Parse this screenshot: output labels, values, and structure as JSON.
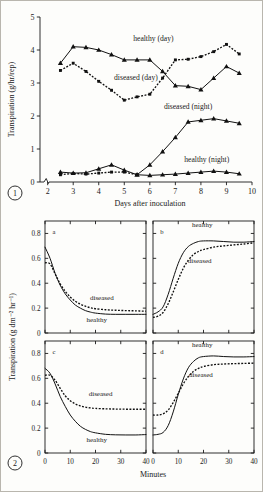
{
  "figure": {
    "panel1_number": "1",
    "panel2_number": "2"
  },
  "chart_data": [
    {
      "type": "line",
      "id": "panel-1",
      "title": "",
      "xlabel": "Days after inoculation",
      "ylabel": "Transpiration (g/hr/rep)",
      "xlim": [
        1.7,
        10
      ],
      "ylim": [
        0,
        5
      ],
      "xticks": [
        2,
        3,
        4,
        5,
        6,
        7,
        8,
        9,
        10
      ],
      "xtick_labels": [
        "2",
        "3",
        "4",
        "5",
        "6",
        "7",
        "8",
        "9",
        "10"
      ],
      "yticks": [
        0,
        1,
        2,
        3,
        4,
        5
      ],
      "ytick_labels": [
        "0",
        "1",
        "2",
        "3",
        "4",
        "5"
      ],
      "axis_break": true,
      "grid": false,
      "legend": "inline-annotations",
      "series": [
        {
          "name": "healthy (day)",
          "style": "solid",
          "marker": "triangle",
          "label_x": 5.35,
          "label_y": 4.27,
          "x": [
            2.5,
            3.0,
            3.5,
            4.0,
            4.5,
            5.0,
            5.5,
            6.0,
            6.5,
            7.0,
            7.5,
            8.0,
            8.5,
            9.0,
            9.5
          ],
          "y": [
            3.6,
            4.1,
            4.08,
            4.0,
            3.86,
            3.7,
            3.7,
            3.7,
            3.35,
            2.92,
            2.9,
            2.8,
            3.15,
            3.5,
            3.3
          ]
        },
        {
          "name": "diseased (day)",
          "style": "dotted",
          "marker": "square",
          "label_x": 4.6,
          "label_y": 3.1,
          "x": [
            2.5,
            3.0,
            3.5,
            4.0,
            4.5,
            5.0,
            5.5,
            6.0,
            6.5,
            7.0,
            7.5,
            8.0,
            8.5,
            9.0,
            9.5
          ],
          "y": [
            3.38,
            3.6,
            3.35,
            3.05,
            2.78,
            2.48,
            2.58,
            2.66,
            3.15,
            3.7,
            3.72,
            3.8,
            3.95,
            4.17,
            3.88
          ]
        },
        {
          "name": "diseased (night)",
          "style": "solid",
          "marker": "triangle",
          "label_x": 6.55,
          "label_y": 2.2,
          "x": [
            5.5,
            6.0,
            6.5,
            7.0,
            7.5,
            8.0,
            8.5,
            9.0,
            9.5
          ],
          "y": [
            0.22,
            0.52,
            0.92,
            1.35,
            1.82,
            1.87,
            1.92,
            1.85,
            1.78
          ]
        },
        {
          "name": "healthy (night)",
          "style": "solid",
          "marker": "triangle",
          "label_x": 7.35,
          "label_y": 0.62,
          "x": [
            2.5,
            3.0,
            3.5,
            4.0,
            4.5,
            5.0,
            5.5,
            6.0,
            6.5,
            7.0,
            7.5,
            8.0,
            8.5,
            9.0,
            9.5
          ],
          "y": [
            0.3,
            0.27,
            0.28,
            0.4,
            0.52,
            0.36,
            0.22,
            0.2,
            0.22,
            0.24,
            0.27,
            0.3,
            0.33,
            0.3,
            0.25
          ]
        },
        {
          "name": "healthy (night) secondary",
          "style": "dotted",
          "marker": "square",
          "x": [
            2.5,
            3.0,
            3.5,
            4.0,
            4.5,
            5.0,
            5.5
          ],
          "y": [
            0.22,
            0.26,
            0.24,
            0.27,
            0.3,
            0.3,
            0.22
          ]
        }
      ]
    },
    {
      "type": "line",
      "id": "panel-2a",
      "letter": "a",
      "xlabel": "Minutes",
      "ylabel": "Transpiration (g dm⁻² hr⁻¹)",
      "xlim": [
        0,
        40
      ],
      "ylim": [
        0,
        0.9
      ],
      "xticks": [
        0,
        10,
        20,
        30,
        40
      ],
      "xtick_labels": [
        "",
        "",
        "",
        "",
        ""
      ],
      "yticks": [
        0,
        0.2,
        0.4,
        0.6,
        0.8
      ],
      "ytick_labels": [
        "0",
        "0.2",
        "0.4",
        "0.6",
        "0.8"
      ],
      "grid": false,
      "series": [
        {
          "name": "healthy",
          "style": "solid",
          "label_x": 20.5,
          "label_y": 0.085,
          "x": [
            0,
            2,
            4,
            6,
            8,
            10,
            12,
            14,
            16,
            18,
            20,
            24,
            28,
            32,
            36,
            40
          ],
          "y": [
            0.69,
            0.6,
            0.48,
            0.385,
            0.315,
            0.265,
            0.225,
            0.2,
            0.18,
            0.168,
            0.16,
            0.152,
            0.15,
            0.15,
            0.15,
            0.15
          ]
        },
        {
          "name": "diseased",
          "style": "dotted",
          "label_x": 22.5,
          "label_y": 0.265,
          "x": [
            0,
            2,
            4,
            6,
            8,
            10,
            12,
            14,
            16,
            18,
            20,
            24,
            28,
            32,
            36,
            40
          ],
          "y": [
            0.565,
            0.555,
            0.475,
            0.395,
            0.335,
            0.29,
            0.255,
            0.232,
            0.215,
            0.203,
            0.195,
            0.187,
            0.183,
            0.18,
            0.178,
            0.175
          ]
        }
      ]
    },
    {
      "type": "line",
      "id": "panel-2b",
      "letter": "b",
      "xlabel": "Minutes",
      "xlim": [
        0,
        40
      ],
      "ylim": [
        0,
        0.9
      ],
      "xticks": [
        0,
        10,
        20,
        30,
        40
      ],
      "xtick_labels": [
        "",
        "",
        "",
        "",
        ""
      ],
      "yticks": [
        0,
        0.2,
        0.4,
        0.6,
        0.8
      ],
      "ytick_labels": [
        "",
        "",
        "",
        "",
        ""
      ],
      "grid": false,
      "series": [
        {
          "name": "healthy",
          "style": "solid",
          "label_x": 19.5,
          "label_y": 0.855,
          "x": [
            0,
            2,
            4,
            6,
            8,
            10,
            12,
            14,
            16,
            18,
            20,
            24,
            28,
            32,
            36,
            40
          ],
          "y": [
            0.15,
            0.17,
            0.21,
            0.31,
            0.44,
            0.56,
            0.645,
            0.695,
            0.72,
            0.735,
            0.74,
            0.74,
            0.735,
            0.73,
            0.73,
            0.735
          ]
        },
        {
          "name": "diseased",
          "style": "dotted",
          "label_x": 18.5,
          "label_y": 0.565,
          "x": [
            0,
            2,
            4,
            6,
            8,
            10,
            12,
            14,
            16,
            18,
            20,
            24,
            28,
            32,
            36,
            40
          ],
          "y": [
            0.125,
            0.135,
            0.165,
            0.235,
            0.33,
            0.43,
            0.52,
            0.585,
            0.63,
            0.655,
            0.67,
            0.69,
            0.7,
            0.708,
            0.715,
            0.725
          ]
        }
      ]
    },
    {
      "type": "line",
      "id": "panel-2c",
      "letter": "c",
      "xlabel": "Minutes",
      "xlim": [
        0,
        40
      ],
      "ylim": [
        0,
        0.9
      ],
      "xticks": [
        0,
        10,
        20,
        30,
        40
      ],
      "xtick_labels": [
        "0",
        "10",
        "20",
        "30",
        "40"
      ],
      "yticks": [
        0,
        0.2,
        0.4,
        0.6,
        0.8
      ],
      "ytick_labels": [
        "0",
        "0.2",
        "0.4",
        "0.6",
        "0.8"
      ],
      "grid": false,
      "series": [
        {
          "name": "healthy",
          "style": "solid",
          "label_x": 20.5,
          "label_y": 0.085,
          "x": [
            0,
            2,
            4,
            6,
            8,
            10,
            12,
            14,
            16,
            18,
            20,
            24,
            28,
            32,
            36,
            40
          ],
          "y": [
            0.68,
            0.64,
            0.555,
            0.455,
            0.375,
            0.305,
            0.255,
            0.215,
            0.19,
            0.172,
            0.162,
            0.15,
            0.146,
            0.145,
            0.145,
            0.148
          ]
        },
        {
          "name": "diseased",
          "style": "dotted",
          "label_x": 22.0,
          "label_y": 0.455,
          "x": [
            0,
            2,
            4,
            6,
            8,
            10,
            12,
            14,
            16,
            18,
            20,
            24,
            28,
            32,
            36,
            40
          ],
          "y": [
            0.625,
            0.625,
            0.585,
            0.52,
            0.46,
            0.42,
            0.395,
            0.378,
            0.368,
            0.362,
            0.358,
            0.355,
            0.353,
            0.352,
            0.352,
            0.352
          ]
        }
      ]
    },
    {
      "type": "line",
      "id": "panel-2d",
      "letter": "d",
      "xlabel": "Minutes",
      "xlim": [
        0,
        40
      ],
      "ylim": [
        0,
        0.9
      ],
      "xticks": [
        0,
        10,
        20,
        30,
        40
      ],
      "xtick_labels": [
        "0",
        "10",
        "20",
        "30",
        "40"
      ],
      "yticks": [
        0,
        0.2,
        0.4,
        0.6,
        0.8
      ],
      "ytick_labels": [
        "",
        "",
        "",
        "",
        ""
      ],
      "grid": false,
      "series": [
        {
          "name": "healthy",
          "style": "solid",
          "label_x": 19.5,
          "label_y": 0.855,
          "x": [
            0,
            2,
            4,
            6,
            8,
            10,
            12,
            14,
            16,
            18,
            20,
            24,
            28,
            32,
            36,
            40
          ],
          "y": [
            0.145,
            0.15,
            0.165,
            0.22,
            0.33,
            0.47,
            0.595,
            0.685,
            0.735,
            0.765,
            0.775,
            0.78,
            0.775,
            0.772,
            0.772,
            0.775
          ]
        },
        {
          "name": "diseased",
          "style": "dotted",
          "label_x": 19.0,
          "label_y": 0.61,
          "x": [
            0,
            2,
            4,
            6,
            8,
            10,
            12,
            14,
            16,
            18,
            20,
            24,
            28,
            32,
            36,
            40
          ],
          "y": [
            0.305,
            0.305,
            0.315,
            0.345,
            0.405,
            0.48,
            0.555,
            0.615,
            0.655,
            0.68,
            0.695,
            0.71,
            0.715,
            0.718,
            0.72,
            0.722
          ]
        }
      ]
    }
  ]
}
